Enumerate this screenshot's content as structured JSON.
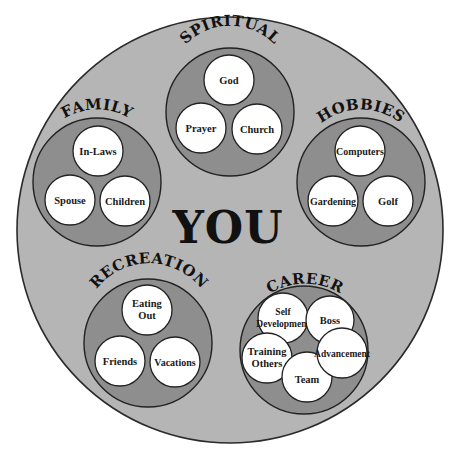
{
  "diagram": {
    "center_label": "YOU",
    "colors": {
      "outer_fill": "#b5b5b5",
      "group_fill": "#8e8e8e",
      "item_fill": "#ffffff",
      "stroke": "#222222",
      "text": "#111111"
    },
    "groups": [
      {
        "label": "SPIRITUAL",
        "items": [
          {
            "lines": [
              "God"
            ]
          },
          {
            "lines": [
              "Prayer"
            ]
          },
          {
            "lines": [
              "Church"
            ]
          }
        ]
      },
      {
        "label": "FAMILY",
        "items": [
          {
            "lines": [
              "In-Laws"
            ]
          },
          {
            "lines": [
              "Spouse"
            ]
          },
          {
            "lines": [
              "Children"
            ]
          }
        ]
      },
      {
        "label": "HOBBIES",
        "items": [
          {
            "lines": [
              "Computers"
            ]
          },
          {
            "lines": [
              "Gardening"
            ]
          },
          {
            "lines": [
              "Golf"
            ]
          }
        ]
      },
      {
        "label": "RECREATION",
        "items": [
          {
            "lines": [
              "Eating",
              "Out"
            ]
          },
          {
            "lines": [
              "Friends"
            ]
          },
          {
            "lines": [
              "Vacations"
            ]
          }
        ]
      },
      {
        "label": "CAREER",
        "items": [
          {
            "lines": [
              "Self",
              "Development"
            ]
          },
          {
            "lines": [
              "Boss"
            ]
          },
          {
            "lines": [
              "Training",
              "Others"
            ]
          },
          {
            "lines": [
              "Advancement"
            ]
          },
          {
            "lines": [
              "Team"
            ]
          }
        ]
      }
    ]
  }
}
